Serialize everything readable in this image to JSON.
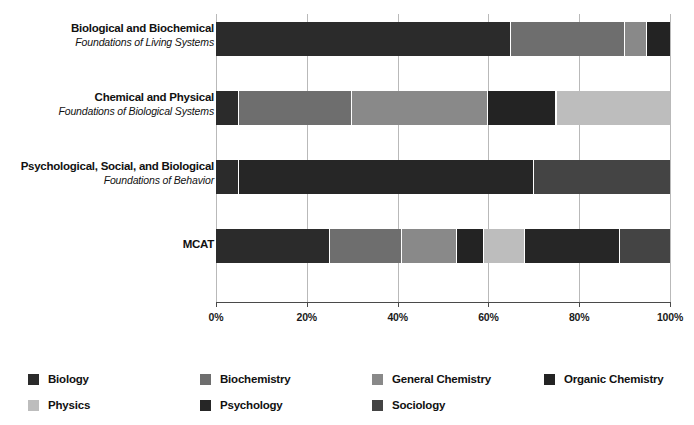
{
  "chart_data": {
    "type": "bar",
    "orientation": "horizontal",
    "stacked": true,
    "normalized": true,
    "title": "",
    "subtitle": "",
    "xlabel": "",
    "ylabel": "",
    "xlim": [
      0,
      100
    ],
    "xticks": [
      0,
      20,
      40,
      60,
      80,
      100
    ],
    "xtick_labels": [
      "0%",
      "20%",
      "40%",
      "60%",
      "80%",
      "100%"
    ],
    "grid": true,
    "grid_axis": "x",
    "legend_position": "bottom",
    "categories": [
      {
        "line1": "Biological and Biochemical",
        "line2": "Foundations of Living Systems"
      },
      {
        "line1": "Chemical and Physical",
        "line2": "Foundations of Biological Systems"
      },
      {
        "line1": "Psychological, Social, and Biological",
        "line2": "Foundations of Behavior"
      },
      {
        "line1": "MCAT",
        "line2": ""
      }
    ],
    "series": [
      {
        "name": "Biology",
        "color": "#2b2b2b",
        "values": [
          65,
          5,
          5,
          25
        ]
      },
      {
        "name": "Biochemistry",
        "color": "#6e6e6e",
        "values": [
          25,
          25,
          0,
          16
        ]
      },
      {
        "name": "General Chemistry",
        "color": "#898989",
        "values": [
          5,
          30,
          0,
          12
        ]
      },
      {
        "name": "Organic Chemistry",
        "color": "#232323",
        "values": [
          5,
          15,
          0,
          6
        ]
      },
      {
        "name": "Physics",
        "color": "#bdbdbd",
        "values": [
          0,
          25,
          0,
          9
        ]
      },
      {
        "name": "Psychology",
        "color": "#262626",
        "values": [
          0,
          0,
          65,
          21
        ]
      },
      {
        "name": "Sociology",
        "color": "#444444",
        "values": [
          0,
          0,
          30,
          11
        ]
      }
    ],
    "legend_entries": [
      {
        "label": "Biology",
        "color": "#2b2b2b"
      },
      {
        "label": "Biochemistry",
        "color": "#6e6e6e"
      },
      {
        "label": "General Chemistry",
        "color": "#898989"
      },
      {
        "label": "Organic Chemistry",
        "color": "#232323"
      },
      {
        "label": "Physics",
        "color": "#bdbdbd"
      },
      {
        "label": "Psychology",
        "color": "#262626"
      },
      {
        "label": "Sociology",
        "color": "#444444"
      }
    ]
  }
}
